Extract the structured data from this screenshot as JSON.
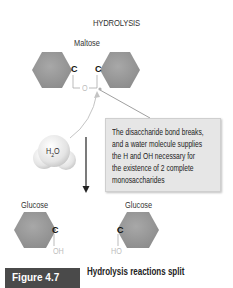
{
  "diagram": {
    "title": "HYDROLYSIS",
    "reactant": {
      "label": "Maltose",
      "left_carbon": "C",
      "right_carbon": "C",
      "bridge_atom": "O"
    },
    "water": {
      "label_main": "H",
      "label_sub": "2",
      "label_end": "O"
    },
    "callout": {
      "lines": [
        "The disaccharide bond breaks,",
        "and a water molecule supplies",
        "the H and OH necessary for",
        "the existence of 2 complete",
        "monosaccharides"
      ]
    },
    "products": [
      {
        "label": "Glucose",
        "carbon": "C",
        "group": "OH"
      },
      {
        "label": "Glucose",
        "carbon": "C",
        "group": "HO"
      }
    ],
    "colors": {
      "hexagon": "#9a9a9a",
      "callout_bg": "#e6e6e6",
      "figure_box": "#4a4a4a"
    }
  },
  "figure": {
    "label": "Figure 4.7",
    "caption": "Hydrolysis reactions split"
  }
}
